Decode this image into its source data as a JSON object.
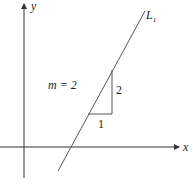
{
  "diagram": {
    "type": "slope-illustration",
    "axes": {
      "x_label": "x",
      "y_label": "y"
    },
    "line": {
      "label": "L",
      "label_subscript": "1",
      "slope_text": "m = 2"
    },
    "triangle": {
      "run_label": "1",
      "rise_label": "2"
    },
    "colors": {
      "stroke": "#333333",
      "background": "#ffffff"
    }
  }
}
